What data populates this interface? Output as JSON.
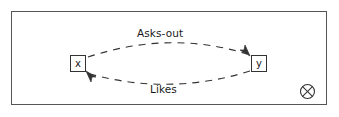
{
  "figure": {
    "type": "relationship-diagram",
    "frame": {
      "border_color": "#555555",
      "background": "#ffffff"
    },
    "nodes": [
      {
        "id": "x",
        "label": "x"
      },
      {
        "id": "y",
        "label": "y"
      }
    ],
    "edges": [
      {
        "id": "asks-out",
        "label": "Asks-out",
        "from": "x",
        "to": "y",
        "style": "dashed",
        "curve": "arc-above",
        "arrowhead": "at-target"
      },
      {
        "id": "likes",
        "label": "Likes",
        "from": "y",
        "to": "x",
        "style": "dashed",
        "curve": "arc-below",
        "arrowhead": "at-target"
      }
    ],
    "corner_marker": {
      "name": "circled-x",
      "glyph": "circle-with-x"
    },
    "colors": {
      "stroke": "#333333",
      "frame_stroke": "#555555",
      "text": "#1a1a1a",
      "background": "#ffffff"
    }
  }
}
